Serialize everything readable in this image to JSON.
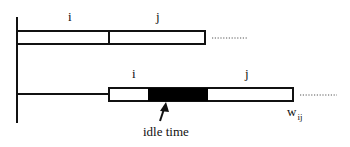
{
  "diagram": {
    "colors": {
      "stroke": "#111111",
      "idle_fill": "#000000",
      "background": "#ffffff",
      "dots": "#555555"
    },
    "top_row": {
      "label_i": "i",
      "label_j": "j",
      "continuation": "..........."
    },
    "bottom_row": {
      "label_i": "i",
      "label_j": "j",
      "continuation": "...........",
      "idle_label": "idle time",
      "weight_label": "w",
      "weight_subscript": "ij"
    }
  }
}
